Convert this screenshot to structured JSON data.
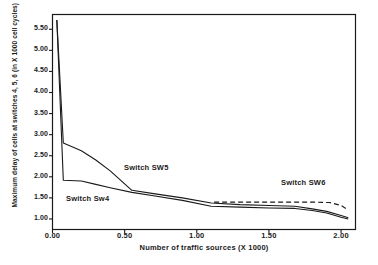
{
  "chart_data": {
    "type": "line",
    "title": "",
    "xlabel": "Number of traffic sources (X 1000)",
    "ylabel": "Maximum delay of cells at switches 4, 5, 6  (in X 1000 cell cycles)",
    "xlim": [
      0.0,
      2.1
    ],
    "ylim": [
      0.75,
      5.85
    ],
    "xticks": [
      "0.00",
      "0.50",
      "1.00",
      "1.50",
      "2.00"
    ],
    "xtick_values": [
      0.0,
      0.5,
      1.0,
      1.5,
      2.0
    ],
    "yticks": [
      "5.50",
      "5.00",
      "4.50",
      "4.00",
      "3.50",
      "3.00",
      "2.50",
      "2.00",
      "1.50",
      "1.00"
    ],
    "ytick_values": [
      5.5,
      5.0,
      4.5,
      4.0,
      3.5,
      3.0,
      2.5,
      2.0,
      1.5,
      1.0
    ],
    "grid": false,
    "legend_position": "inline-annotations",
    "frame": true,
    "series": [
      {
        "name": "Switch Sw4",
        "style": "solid",
        "color": "#1a1a1a",
        "x": [
          0.03,
          0.075,
          0.2,
          0.3,
          0.4,
          0.55,
          0.7,
          0.9,
          1.1,
          1.3,
          1.5,
          1.68,
          1.8,
          1.9,
          2.0,
          2.05
        ],
        "y": [
          5.72,
          1.92,
          1.9,
          1.82,
          1.74,
          1.63,
          1.55,
          1.44,
          1.3,
          1.28,
          1.26,
          1.25,
          1.2,
          1.14,
          1.04,
          1.0
        ]
      },
      {
        "name": "Switch SW5",
        "style": "solid",
        "color": "#1a1a1a",
        "x": [
          0.03,
          0.075,
          0.2,
          0.3,
          0.4,
          0.55,
          0.7,
          0.9,
          1.1,
          1.3,
          1.5,
          1.68,
          1.8,
          1.9,
          2.0,
          2.05
        ],
        "y": [
          5.72,
          2.8,
          2.62,
          2.4,
          2.14,
          1.68,
          1.6,
          1.5,
          1.38,
          1.34,
          1.32,
          1.3,
          1.24,
          1.18,
          1.08,
          1.03
        ]
      },
      {
        "name": "Switch SW6",
        "style": "dashed",
        "color": "#1a1a1a",
        "x": [
          1.12,
          1.3,
          1.5,
          1.68,
          1.8,
          1.92,
          2.0,
          2.05
        ],
        "y": [
          1.4,
          1.4,
          1.4,
          1.4,
          1.4,
          1.39,
          1.32,
          1.21
        ]
      }
    ],
    "annotations": [
      {
        "text": "Switch Sw4",
        "x_px": 66,
        "y_px": 194
      },
      {
        "text": "Switch SW5",
        "x_px": 124,
        "y_px": 163
      },
      {
        "text": "Switch SW6",
        "x_px": 281,
        "y_px": 178
      }
    ]
  }
}
